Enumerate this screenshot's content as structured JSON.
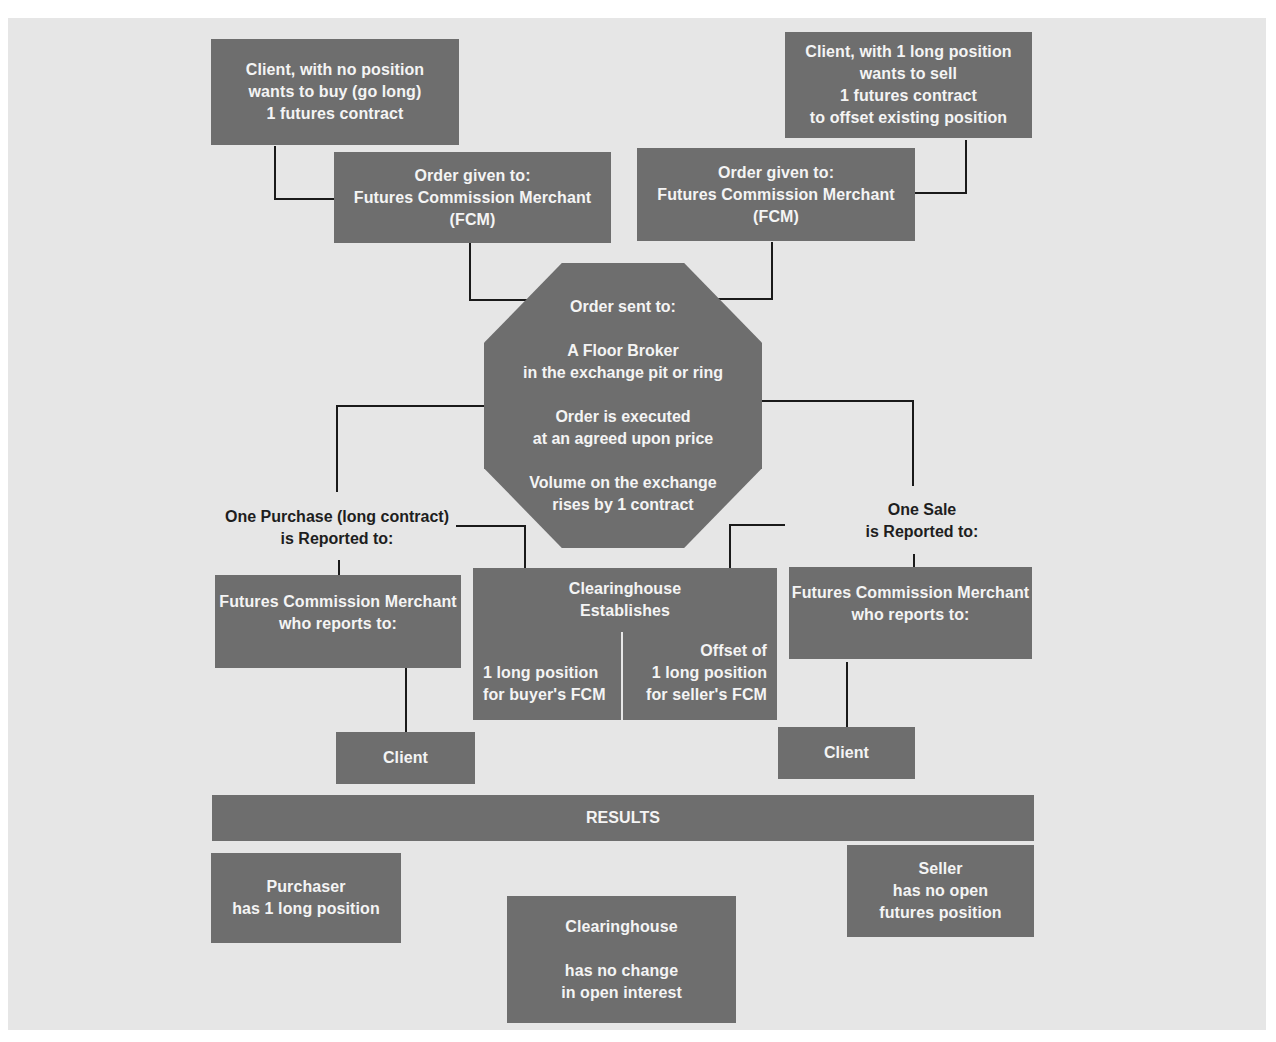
{
  "diagram": {
    "type": "flowchart",
    "colors": {
      "box": "#6e6e6e",
      "box_text": "#f4f4f4",
      "background": "#e6e6e6",
      "line": "#1a1a1a"
    },
    "buyer_client": {
      "lines": [
        "Client, with  no position",
        "wants to buy (go long)",
        "1 futures contract"
      ]
    },
    "seller_client": {
      "lines": [
        "Client, with 1 long position",
        "wants to sell",
        "1 futures contract",
        "to offset existing position"
      ]
    },
    "buyer_fcm_order": {
      "lines": [
        "Order given to:",
        "Futures Commission Merchant",
        "(FCM)"
      ]
    },
    "seller_fcm_order": {
      "lines": [
        "Order given to:",
        "Futures Commission Merchant",
        "(FCM)"
      ]
    },
    "floor": {
      "title": "Order sent to:",
      "broker": [
        "A Floor Broker",
        "in the exchange pit or ring"
      ],
      "executed": [
        "Order is executed",
        "at an agreed upon price"
      ],
      "volume": [
        "Volume on the exchange",
        "rises by 1 contract"
      ]
    },
    "purchase_label": {
      "lines": [
        "One Purchase (long contract)",
        "is Reported to:"
      ]
    },
    "sale_label": {
      "lines": [
        "One Sale",
        "is Reported to:"
      ]
    },
    "buyer_fcm_report": {
      "lines": [
        "Futures Commission Merchant",
        "who reports to:"
      ]
    },
    "seller_fcm_report": {
      "lines": [
        "Futures Commission Merchant",
        "who reports to:"
      ]
    },
    "clearinghouse": {
      "title": [
        "Clearinghouse",
        "Establishes"
      ],
      "left": [
        "1 long position",
        "for buyer's FCM"
      ],
      "right": [
        "Offset of",
        "1 long position",
        "for seller's FCM"
      ]
    },
    "buyer_client_end": {
      "label": "Client"
    },
    "seller_client_end": {
      "label": "Client"
    },
    "results": {
      "header": "RESULTS",
      "purchaser": [
        "Purchaser",
        "has 1 long position"
      ],
      "clearinghouse": [
        "Clearinghouse",
        "",
        "has no change",
        "in open interest"
      ],
      "seller": [
        "Seller",
        "has no open",
        "futures position"
      ]
    }
  }
}
